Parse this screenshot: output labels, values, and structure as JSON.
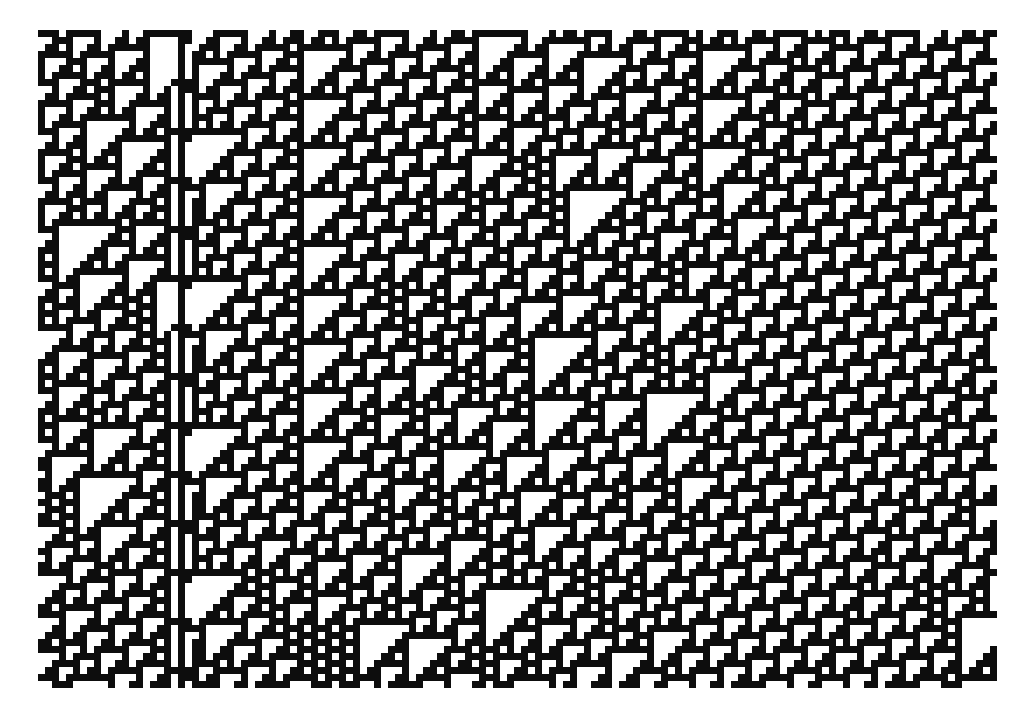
{
  "canvas": {
    "width": 1034,
    "height": 715,
    "background_color": "#ffffff"
  },
  "automaton": {
    "name": "Rule 110 elementary cellular automaton",
    "rule_number": 110,
    "rule_binary": "01101110",
    "states": 2,
    "neighborhood": 3,
    "alive_color": "#0d0d0d",
    "dead_color": "#ffffff",
    "cell_size_px": 7,
    "columns": 137,
    "rows": 94,
    "origin_x_px": 38,
    "origin_y_px": 30,
    "grid_width_px": 959,
    "grid_height_px": 658,
    "boundary": "periodic",
    "time_direction": "downward",
    "rule_table": {
      "111": 0,
      "110": 1,
      "101": 1,
      "100": 0,
      "011": 1,
      "010": 1,
      "001": 1,
      "000": 0
    },
    "seed": 110110,
    "seed_density": 0.5,
    "glider_column": 20,
    "glider_period": 7,
    "glider_label": "vertical stationary structure"
  },
  "chart_data": {
    "type": "heatmap",
    "title": "",
    "xlabel": "",
    "ylabel": "",
    "legend": [],
    "grid": false,
    "colormap": [
      "#ffffff",
      "#0d0d0d"
    ],
    "value_range": [
      0,
      1
    ],
    "x_range": [
      0,
      137
    ],
    "y_range": [
      0,
      94
    ],
    "note": "Binary space-time diagram: each row is one generation of Rule 110; columns are cells; black = state 1, white = state 0."
  }
}
